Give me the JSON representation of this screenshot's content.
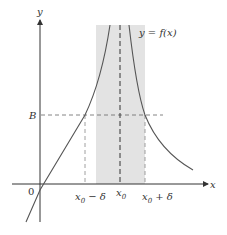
{
  "diagram": {
    "axes": {
      "x_label": "x",
      "y_label": "y",
      "origin_label": "0"
    },
    "function_label": "y = f(x)",
    "levels": {
      "B_label": "B"
    },
    "x_ticks": {
      "left": {
        "main": "x",
        "sub": "0",
        "suffix": " − δ"
      },
      "center": {
        "main": "x",
        "sub": "0"
      },
      "right": {
        "main": "x",
        "sub": "0",
        "suffix": " + δ"
      }
    },
    "colors": {
      "curve": "#555555",
      "axis": "#333333",
      "shading": "#e0e0e0",
      "dashed": "#666666"
    }
  }
}
